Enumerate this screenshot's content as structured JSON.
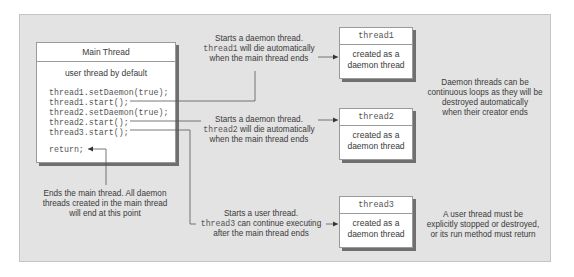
{
  "main_thread": {
    "title": "Main Thread",
    "subtitle": "user thread by default",
    "code": [
      "thread1.setDaemon(true);",
      "thread1.start();",
      "thread2.setDaemon(true);",
      "thread2.start();",
      "thread3.start();"
    ],
    "return_stmt": "return;"
  },
  "threads": [
    {
      "name": "thread1",
      "line1": "created as a",
      "line2": "daemon thread"
    },
    {
      "name": "thread2",
      "line1": "created as a",
      "line2": "daemon thread"
    },
    {
      "name": "thread3",
      "line1": "created as a",
      "line2": "daemon thread"
    }
  ],
  "annotations": {
    "thread1": {
      "line1": "Starts a daemon thread.",
      "code": "thread1",
      "line2_rest": " will die automatically",
      "line3": "when the main thread ends"
    },
    "thread2": {
      "line1": "Starts a daemon thread.",
      "code": "thread2",
      "line2_rest": " will die automatically",
      "line3": "when the main thread ends"
    },
    "thread3": {
      "line1": "Starts a user thread.",
      "code": "thread3",
      "line2_rest": " can continue executing",
      "line3": "after the main thread ends"
    },
    "return": {
      "line1": "Ends the main thread. All daemon",
      "line2": "threads created in the main thread",
      "line3": "will end at this point"
    },
    "daemon_note": {
      "line1": "Daemon threads can be",
      "line2": "continuous loops as they will be",
      "line3": "destroyed automatically",
      "line4": "when their creator ends"
    },
    "user_note": {
      "line1": "A user thread must be",
      "line2": "explicitly stopped or destroyed,",
      "line3": "or its run method must return"
    }
  },
  "colors": {
    "panel": "#e3e3e3",
    "box": "#ffffff",
    "shadow": "#6f6f6f",
    "line": "#555555"
  }
}
